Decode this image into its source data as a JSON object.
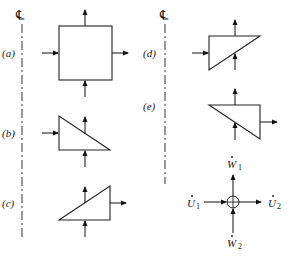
{
  "figure": {
    "centerline_symbol": "℄",
    "panels": [
      {
        "id": "a",
        "label": "(a)",
        "shape": "square"
      },
      {
        "id": "b",
        "label": "(b)",
        "shape": "right-triangle-top-left"
      },
      {
        "id": "c",
        "label": "(c)",
        "shape": "right-triangle-top-right"
      },
      {
        "id": "d",
        "label": "(d)",
        "shape": "right-triangle-bottom-left"
      },
      {
        "id": "e",
        "label": "(e)",
        "shape": "right-triangle-bottom-right"
      }
    ],
    "legend": {
      "w1": {
        "symbol": "W",
        "sub": "1"
      },
      "w2": {
        "symbol": "W",
        "sub": "2"
      },
      "u1": {
        "symbol": "U",
        "sub": "1"
      },
      "u2": {
        "symbol": "U",
        "sub": "2"
      }
    },
    "colors": {
      "line": "#222222",
      "background": "#ffffff"
    }
  }
}
